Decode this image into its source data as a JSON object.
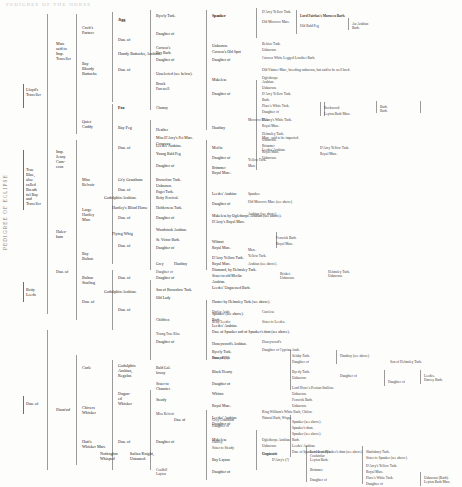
{
  "document": {
    "type": "pedigree-chart",
    "header_faint": "PEDIGREE  OF  THE  HORSE",
    "left_caption": "PEDIGREE OF ECLIPSE"
  },
  "vertical_labels": [
    {
      "text": "PEDIGREE OF ECLIPSE"
    }
  ],
  "gen1": [
    {
      "label": "Lloyd's\nTraveller",
      "top": 88,
      "left": 26
    },
    {
      "label": "True\nBlue,\nalso\ncalled\nBreath\nful Bay\nand\nTraveller",
      "top": 168,
      "left": 26
    },
    {
      "label": "Betty\nLeeds",
      "top": 288,
      "left": 26
    },
    {
      "label": "Dau. of",
      "top": 402,
      "left": 26
    }
  ],
  "gen2": [
    {
      "label": "Mare\nsaid to\nImp.\nTraveller",
      "top": 42,
      "left": 56
    },
    {
      "label": "Imp.\nJenny\nCam-\neron",
      "top": 150,
      "left": 56
    },
    {
      "label": "Hales-\nham",
      "top": 230,
      "left": 56
    },
    {
      "label": "Dau. of",
      "top": 270,
      "left": 56
    },
    {
      "label": "Diam'nd",
      "top": 408,
      "left": 56
    }
  ],
  "gen3": [
    {
      "label": "Croft's\nPartner",
      "top": 26,
      "left": 82
    },
    {
      "label": "Bay\nBloody\nButtocks",
      "top": 62,
      "left": 82
    },
    {
      "label": "Quiet\nCuddy",
      "top": 120,
      "left": 82
    },
    {
      "label": "Miss\nBelvoir",
      "top": 178,
      "left": 82
    },
    {
      "label": "Large\nHartley\nMare",
      "top": 208,
      "left": 82
    },
    {
      "label": "Bay\nBolton",
      "top": 252,
      "left": 82
    },
    {
      "label": "Bolton\nStarling",
      "top": 276,
      "left": 82
    },
    {
      "label": "Dau. of",
      "top": 300,
      "left": 82
    },
    {
      "label": "Curle",
      "top": 366,
      "left": 82
    },
    {
      "label": "Chivers\nWhisker",
      "top": 406,
      "left": 82
    },
    {
      "label": "Hutt's\nWhisker Mare",
      "top": 440,
      "left": 82
    }
  ],
  "gen4": [
    {
      "label": "Jigg",
      "top": 18,
      "left": 118,
      "bold": true
    },
    {
      "label": "Dau. of",
      "top": 38,
      "left": 118
    },
    {
      "label": "Hundy Buttocks, Arabian.",
      "top": 52,
      "left": 118
    },
    {
      "label": "Dau. of",
      "top": 68,
      "left": 118
    },
    {
      "label": "Fox",
      "top": 106,
      "left": 118,
      "bold": true
    },
    {
      "label": "Bay Peg",
      "top": 126,
      "left": 118
    },
    {
      "label": "Dau. of",
      "top": 146,
      "left": 118
    },
    {
      "label": "Gr'y Grantham",
      "top": 178,
      "left": 118
    },
    {
      "label": "Dau. of",
      "top": 188,
      "left": 118
    },
    {
      "label": "Godolphin Arabian.",
      "top": 196,
      "left": 104
    },
    {
      "label": "Hartley's Blind Horse",
      "top": 206,
      "left": 112
    },
    {
      "label": "Dau. of",
      "top": 216,
      "left": 118
    },
    {
      "label": "Flying Whig",
      "top": 232,
      "left": 112
    },
    {
      "label": "Dau. of",
      "top": 244,
      "left": 118
    },
    {
      "label": "Dau. of",
      "top": 276,
      "left": 118
    },
    {
      "label": "Godolphin Arabian.",
      "top": 290,
      "left": 104
    },
    {
      "label": "Dau. of",
      "top": 308,
      "left": 118
    },
    {
      "label": "Godolphin\nArabian,\nRegulus",
      "top": 364,
      "left": 118
    },
    {
      "label": "Dugon-\ned\nWhisker",
      "top": 392,
      "left": 118
    },
    {
      "label": "Dau. of",
      "top": 440,
      "left": 118
    },
    {
      "label": "Nottinghm\nWhisperl",
      "top": 452,
      "left": 100
    },
    {
      "label": "Italian Knight,\nUntamed.",
      "top": 452,
      "left": 130
    }
  ],
  "gen5": [
    {
      "label": "Byerly Turk.",
      "top": 14,
      "left": 156,
      "bold": false
    },
    {
      "label": "Daughter of",
      "top": 32,
      "left": 156
    },
    {
      "label": "Curwen's\nBay Barb.",
      "top": 46,
      "left": 156
    },
    {
      "label": "Daughter of",
      "top": 58,
      "left": 156
    },
    {
      "label": "Unselected (see below).",
      "top": 72,
      "left": 156
    },
    {
      "label": "Brock\nFarewell",
      "top": 82,
      "left": 156
    },
    {
      "label": "Clumsy",
      "top": 106,
      "left": 156
    },
    {
      "label": "Heather",
      "top": 128,
      "left": 156
    },
    {
      "label": "Miss D'Arcy's Pet Mare.",
      "top": 136,
      "left": 156
    },
    {
      "label": "Leedes' Arabian.",
      "top": 144,
      "left": 156
    },
    {
      "label": "Young Bald Peg",
      "top": 152,
      "left": 156
    },
    {
      "label": "Conaway",
      "top": 142,
      "left": 156
    },
    {
      "label": "Daughter of",
      "top": 164,
      "left": 156
    },
    {
      "label": "Browclow Turk.",
      "top": 178,
      "left": 156
    },
    {
      "label": "Unknown.",
      "top": 184,
      "left": 156
    },
    {
      "label": "Paget Turk.",
      "top": 190,
      "left": 156
    },
    {
      "label": "Betty Percival.",
      "top": 196,
      "left": 156
    },
    {
      "label": "Holderness Turk.",
      "top": 206,
      "left": 156
    },
    {
      "label": "Daughter of",
      "top": 216,
      "left": 156
    },
    {
      "label": "Woodstock Arabian.",
      "top": 228,
      "left": 156
    },
    {
      "label": "St. Victor Barb.",
      "top": 238,
      "left": 156
    },
    {
      "label": "Daughter of",
      "top": 246,
      "left": 156
    },
    {
      "label": "Grey",
      "top": 262,
      "left": 156
    },
    {
      "label": "Hautboy",
      "top": 262,
      "left": 174
    },
    {
      "label": "Daughter of",
      "top": 276,
      "left": 156
    },
    {
      "label": "Son of Brownlow Turk.",
      "top": 288,
      "left": 156
    },
    {
      "label": "Old Lady",
      "top": 296,
      "left": 156
    },
    {
      "label": "Children",
      "top": 318,
      "left": 156
    },
    {
      "label": "Daughter of",
      "top": 340,
      "left": 156
    },
    {
      "label": "Bald Gal.\nloway",
      "top": 366,
      "left": 156
    },
    {
      "label": "Sister to\nChaunter",
      "top": 382,
      "left": 156
    },
    {
      "label": "Steady",
      "top": 398,
      "left": 156
    },
    {
      "label": "Dau. of",
      "top": 418,
      "left": 174
    },
    {
      "label": "Daughter of",
      "top": 440,
      "left": 156
    }
  ],
  "gen6": [
    {
      "label": "Spanker",
      "top": 14,
      "left": 212,
      "bold": true
    },
    {
      "label": "Unknown.",
      "top": 44,
      "left": 212
    },
    {
      "label": "Curwen's Old Spot",
      "top": 50,
      "left": 212
    },
    {
      "label": "Daughter of",
      "top": 58,
      "left": 212
    },
    {
      "label": "Makeless",
      "top": 78,
      "left": 212
    },
    {
      "label": "Daughter of",
      "top": 92,
      "left": 212
    },
    {
      "label": "Hautboy",
      "top": 126,
      "left": 212
    },
    {
      "label": "Merlin",
      "top": 146,
      "left": 212
    },
    {
      "label": "Daughter of",
      "top": 156,
      "left": 212
    },
    {
      "label": "Brimmer\nRoyal Mare.",
      "top": 166,
      "left": 212
    },
    {
      "label": "Leedes' Arabian",
      "top": 192,
      "left": 212
    },
    {
      "label": "Daughter of",
      "top": 202,
      "left": 212
    },
    {
      "label": "Makeless by Oglethorpe Arabian (see above).",
      "top": 214,
      "left": 212
    },
    {
      "label": "D'Arcy's Royal Mare.",
      "top": 220,
      "left": 212
    },
    {
      "label": "Wilmot",
      "top": 240,
      "left": 212
    },
    {
      "label": "Royal Mare.",
      "top": 246,
      "left": 212
    },
    {
      "label": "D'Arcy Yellow Turk.",
      "top": 256,
      "left": 212
    },
    {
      "label": "Royal Mare.",
      "top": 262,
      "left": 212
    },
    {
      "label": "Diamond, by Helmsley Turk.",
      "top": 268,
      "left": 212
    },
    {
      "label": "Sister to old Merlin",
      "top": 274,
      "left": 212
    },
    {
      "label": "Arabian.",
      "top": 280,
      "left": 212
    },
    {
      "label": "Leedes' Unguessed Barb.",
      "top": 286,
      "left": 212
    },
    {
      "label": "Hunter by Helmsley Turk (see above).",
      "top": 300,
      "left": 212
    },
    {
      "label": "Spanker (see above).",
      "top": 312,
      "left": 212
    },
    {
      "label": "Barb.",
      "top": 318,
      "left": 212
    },
    {
      "label": "Leedes' Arabian.",
      "top": 324,
      "left": 212
    },
    {
      "label": "Dau. of Spanker and of Spanker's dam (see above).",
      "top": 330,
      "left": 212
    },
    {
      "label": "Honeywood's Arabian.",
      "top": 342,
      "left": 212
    },
    {
      "label": "Byerly Turk.",
      "top": 350,
      "left": 212
    },
    {
      "label": "Dau. of (?)",
      "top": 356,
      "left": 212
    },
    {
      "label": "Black Hearty",
      "top": 370,
      "left": 212
    },
    {
      "label": "Daughter of",
      "top": 382,
      "left": 212
    },
    {
      "label": "Whiton",
      "top": 392,
      "left": 212
    },
    {
      "label": "Royal Mare.",
      "top": 404,
      "left": 212
    },
    {
      "label": "Leedes' Arabian",
      "top": 416,
      "left": 212
    },
    {
      "label": "Daughter of",
      "top": 422,
      "left": 212
    },
    {
      "label": "Makeless",
      "top": 438,
      "left": 212
    },
    {
      "label": "Bay Layton",
      "top": 458,
      "left": 212
    },
    {
      "label": "Daughter of",
      "top": 470,
      "left": 212
    }
  ],
  "gen7": [
    {
      "label": "D'Arcy Yellow Turk.",
      "top": 10,
      "left": 262
    },
    {
      "label": "Old Morocco Mare.",
      "top": 20,
      "left": 262
    },
    {
      "label": "Lord Fairfax's Morocco Barb.",
      "top": 14,
      "left": 300,
      "bold": true
    },
    {
      "label": "Old Bald Peg",
      "top": 24,
      "left": 300
    },
    {
      "label": "An Arabian\nBarb.",
      "top": 22,
      "left": 352
    },
    {
      "label": "Belsize Turk.",
      "top": 42,
      "left": 262
    },
    {
      "label": "Unknown.",
      "top": 48,
      "left": 262
    },
    {
      "label": "Curwen White Legged Lowther Barb.",
      "top": 56,
      "left": 262
    },
    {
      "label": "Old Vintner Mare, breeding unknown, but said to be well bred.",
      "top": 68,
      "left": 262,
      "bold": false
    },
    {
      "label": "Oglethorpe\nArabian.",
      "top": 76,
      "left": 262
    },
    {
      "label": "Unknown.",
      "top": 86,
      "left": 262
    },
    {
      "label": "D'Arcy Yellow Turk.",
      "top": 92,
      "left": 262
    },
    {
      "label": "Barb.",
      "top": 98,
      "left": 262
    },
    {
      "label": "Place's White Turk.",
      "top": 104,
      "left": 262
    },
    {
      "label": "Daughter of",
      "top": 110,
      "left": 262
    },
    {
      "label": "Rockwood",
      "top": 106,
      "left": 324
    },
    {
      "label": "Leyton Barb Mare.",
      "top": 112,
      "left": 324
    },
    {
      "label": "Barb.\nBarb.",
      "top": 105,
      "left": 380
    },
    {
      "label": "D'Arcy's White Turk.",
      "top": 118,
      "left": 262
    },
    {
      "label": "Royal Mare.",
      "top": 124,
      "left": 262
    },
    {
      "label": "Mare, said to be imported.",
      "top": 136,
      "left": 262
    },
    {
      "label": "Leedes' Arabian.",
      "top": 148,
      "left": 262
    },
    {
      "label": "Unknown.",
      "top": 156,
      "left": 262
    },
    {
      "label": "Morocco Mare.",
      "top": 118,
      "left": 248
    },
    {
      "label": "Helmsley Turk.",
      "top": 132,
      "left": 262
    },
    {
      "label": "Unknown.",
      "top": 138,
      "left": 262
    },
    {
      "label": "Brimmer",
      "top": 144,
      "left": 262
    },
    {
      "label": "Royal Mare.",
      "top": 150,
      "left": 262
    },
    {
      "label": "D'Arcy Yellow Turk.",
      "top": 146,
      "left": 320
    },
    {
      "label": "Royal Mare.",
      "top": 152,
      "left": 320
    },
    {
      "label": "Yellow Turk.",
      "top": 158,
      "left": 248
    },
    {
      "label": "Mare.",
      "top": 164,
      "left": 248
    },
    {
      "label": "Spanker.",
      "top": 192,
      "left": 248
    },
    {
      "label": "Old Morocco Mare (see above).",
      "top": 200,
      "left": 248
    },
    {
      "label": "Arabian (see above).",
      "top": 212,
      "left": 248
    },
    {
      "label": "Fenwick Barb.",
      "top": 236,
      "left": 276
    },
    {
      "label": "Royal Mare.",
      "top": 242,
      "left": 276
    },
    {
      "label": "Mare.",
      "top": 248,
      "left": 248
    },
    {
      "label": "Yellow Turk.",
      "top": 254,
      "left": 248
    },
    {
      "label": "Arabian (see above).",
      "top": 262,
      "left": 248
    },
    {
      "label": "Brisket\nUnknown.",
      "top": 272,
      "left": 280
    },
    {
      "label": "Helmsley Turk.\nUnknown.",
      "top": 270,
      "left": 328
    },
    {
      "label": "Selaby Turk.",
      "top": 354,
      "left": 292
    },
    {
      "label": "Daughter of",
      "top": 360,
      "left": 292
    },
    {
      "label": "Hautboy (see above).",
      "top": 354,
      "left": 340
    },
    {
      "label": "Son of Helmsley Turk.",
      "top": 360,
      "left": 390
    },
    {
      "label": "Byerly Turk.",
      "top": 370,
      "left": 292
    },
    {
      "label": "Unknown.",
      "top": 376,
      "left": 292
    },
    {
      "label": "Daughter of",
      "top": 374,
      "left": 340
    },
    {
      "label": "Daughter of",
      "top": 380,
      "left": 388
    },
    {
      "label": "Leedes.\nDarcey Barb.",
      "top": 374,
      "left": 424
    },
    {
      "label": "Lord Howe's Persian Stallion.",
      "top": 386,
      "left": 292
    },
    {
      "label": "Unknown.",
      "top": 392,
      "left": 292
    },
    {
      "label": "Fenwick Barb.",
      "top": 398,
      "left": 292
    },
    {
      "label": "Unknown.",
      "top": 404,
      "left": 292
    },
    {
      "label": "Spanker (see above).",
      "top": 420,
      "left": 292
    },
    {
      "label": "Spanker's dam.",
      "top": 426,
      "left": 292
    },
    {
      "label": "Spanker (see above).",
      "top": 432,
      "left": 292
    },
    {
      "label": "Barb.",
      "top": 438,
      "left": 292
    },
    {
      "label": "Leedes' Arabian.",
      "top": 444,
      "left": 292
    },
    {
      "label": "Dau. of Spanker out of Spanker's dam (see above).",
      "top": 450,
      "left": 292
    },
    {
      "label": "Oglethorpe Arabian.",
      "top": 438,
      "left": 262
    },
    {
      "label": "Unknown.",
      "top": 444,
      "left": 262
    },
    {
      "label": "Unguess'd",
      "top": 452,
      "left": 262
    },
    {
      "label": "D'Arcy's (?)",
      "top": 458,
      "left": 272
    },
    {
      "label": "Lord Lonsd'l's\nCoalstrilar",
      "top": 450,
      "left": 310
    },
    {
      "label": "Leyton Barb.",
      "top": 458,
      "left": 310
    },
    {
      "label": "Shaftsbury Turk.",
      "top": 450,
      "left": 366
    },
    {
      "label": "Sister to Spanker (see above).",
      "top": 456,
      "left": 366
    },
    {
      "label": "Brimmer",
      "top": 468,
      "left": 310
    },
    {
      "label": "Daughter of",
      "top": 478,
      "left": 310
    },
    {
      "label": "D'Arcy's Yellow Turk.",
      "top": 464,
      "left": 366
    },
    {
      "label": "Royal Mare.",
      "top": 470,
      "left": 366
    },
    {
      "label": "Place's White Turk.",
      "top": 476,
      "left": 366
    },
    {
      "label": "Daughter of",
      "top": 482,
      "left": 366
    },
    {
      "label": "Unknown (Barb).\nLeyton Barb Mare.",
      "top": 476,
      "left": 424
    },
    {
      "label": "King William's White Barb, Chilon.",
      "top": 410,
      "left": 262
    },
    {
      "label": "Natural Barb, Wispy.",
      "top": 416,
      "left": 262
    }
  ],
  "misc_labels": [
    {
      "label": "Daughter of",
      "top": 270,
      "left": 156
    },
    {
      "label": "Darley Arab.",
      "top": 310,
      "left": 212
    },
    {
      "label": "Betty Leedes",
      "top": 320,
      "left": 212
    },
    {
      "label": "Careless",
      "top": 310,
      "left": 262
    },
    {
      "label": "Sister to Leedes.",
      "top": 320,
      "left": 262
    },
    {
      "label": "Young True Blue",
      "top": 332,
      "left": 156
    },
    {
      "label": "Honeywood's",
      "top": 340,
      "left": 262
    },
    {
      "label": "Daughter of Cyprian Arab.",
      "top": 348,
      "left": 262
    },
    {
      "label": "Sunny Black",
      "top": 356,
      "left": 212
    },
    {
      "label": "Miss Belvoir",
      "top": 412,
      "left": 156
    },
    {
      "label": "Grey Grantham",
      "top": 418,
      "left": 212
    },
    {
      "label": "Daughter of",
      "top": 424,
      "left": 212
    },
    {
      "label": "Hartley",
      "top": 440,
      "left": 212
    },
    {
      "label": "Sister to Steady",
      "top": 446,
      "left": 212
    },
    {
      "label": "Graybourn",
      "top": 452,
      "left": 262
    },
    {
      "label": "Coalhill\nLayton",
      "top": 468,
      "left": 156
    }
  ]
}
